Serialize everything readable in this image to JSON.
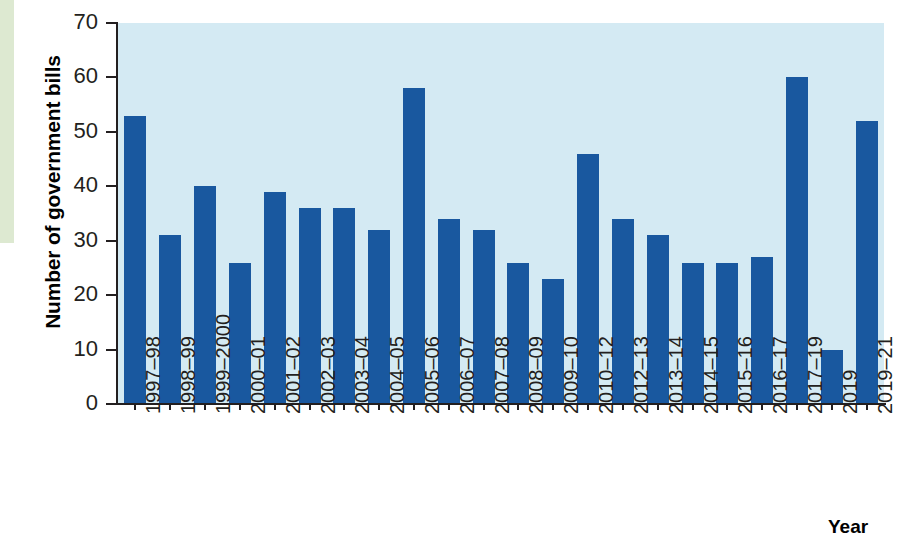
{
  "chart_data": {
    "type": "bar",
    "title": "",
    "xlabel": "Year",
    "ylabel": "Number of government bills",
    "ylim": [
      0,
      70
    ],
    "ytick_values": [
      0,
      10,
      20,
      30,
      40,
      50,
      60,
      70
    ],
    "ytick_labels": [
      "0",
      "10",
      "20",
      "30",
      "40",
      "50",
      "60",
      "70"
    ],
    "grid": false,
    "legend": null,
    "bar_color": "#19589f",
    "plot_background": "#d4eaf3",
    "categories": [
      "1997–98",
      "1998–99",
      "1999–2000",
      "2000–01",
      "2001–02",
      "2002–03",
      "2003–04",
      "2004–05",
      "2005–06",
      "2006–07",
      "2007–08",
      "2008–09",
      "2009–10",
      "2010–12",
      "2012–13",
      "2013–14",
      "2014–15",
      "2015–16",
      "2016–17",
      "2017–19",
      "2019",
      "2019–21"
    ],
    "values": [
      53,
      31,
      40,
      26,
      39,
      36,
      36,
      32,
      58,
      34,
      32,
      26,
      23,
      46,
      34,
      31,
      26,
      26,
      27,
      60,
      10,
      52
    ]
  },
  "decoration": {
    "green_strip_color": "#dde9d1"
  }
}
